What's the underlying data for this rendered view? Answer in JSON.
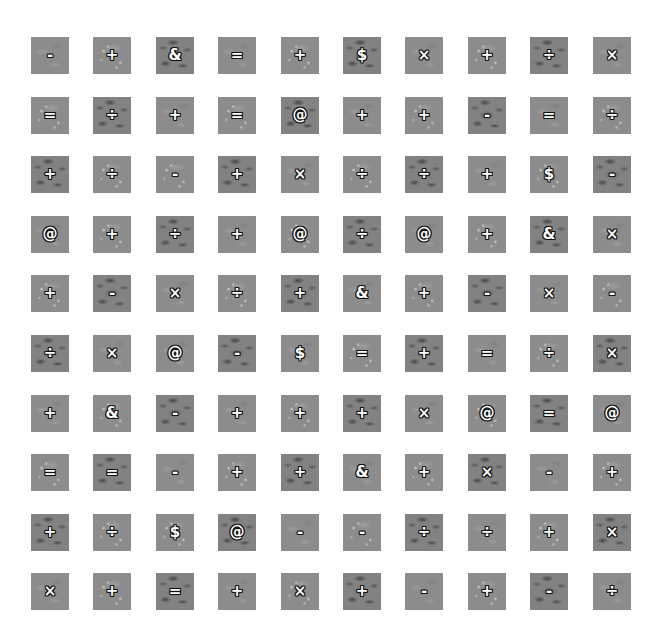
{
  "board": {
    "rows": 10,
    "cols": 10,
    "tiles": [
      [
        {
          "s": "-",
          "v": "plain"
        },
        {
          "s": "+",
          "v": "light"
        },
        {
          "s": "&",
          "v": "dark"
        },
        {
          "s": "=",
          "v": "plain"
        },
        {
          "s": "+",
          "v": "light"
        },
        {
          "s": "$",
          "v": "dark"
        },
        {
          "s": "×",
          "v": "plain"
        },
        {
          "s": "+",
          "v": "light"
        },
        {
          "s": "÷",
          "v": "dark"
        },
        {
          "s": "×",
          "v": "plain"
        }
      ],
      [
        {
          "s": "=",
          "v": "light"
        },
        {
          "s": "÷",
          "v": "dark"
        },
        {
          "s": "+",
          "v": "plain"
        },
        {
          "s": "=",
          "v": "light"
        },
        {
          "s": "@",
          "v": "dark"
        },
        {
          "s": "+",
          "v": "plain"
        },
        {
          "s": "+",
          "v": "light"
        },
        {
          "s": "-",
          "v": "dark"
        },
        {
          "s": "=",
          "v": "plain"
        },
        {
          "s": "÷",
          "v": "light"
        }
      ],
      [
        {
          "s": "+",
          "v": "dark"
        },
        {
          "s": "÷",
          "v": "light"
        },
        {
          "s": "-",
          "v": "light"
        },
        {
          "s": "+",
          "v": "dark"
        },
        {
          "s": "×",
          "v": "plain"
        },
        {
          "s": "÷",
          "v": "light"
        },
        {
          "s": "÷",
          "v": "dark"
        },
        {
          "s": "+",
          "v": "plain"
        },
        {
          "s": "$",
          "v": "light"
        },
        {
          "s": "-",
          "v": "dark"
        }
      ],
      [
        {
          "s": "@",
          "v": "plain"
        },
        {
          "s": "+",
          "v": "light"
        },
        {
          "s": "÷",
          "v": "dark"
        },
        {
          "s": "+",
          "v": "plain"
        },
        {
          "s": "@",
          "v": "light"
        },
        {
          "s": "÷",
          "v": "dark"
        },
        {
          "s": "@",
          "v": "plain"
        },
        {
          "s": "+",
          "v": "light"
        },
        {
          "s": "&",
          "v": "dark"
        },
        {
          "s": "×",
          "v": "plain"
        }
      ],
      [
        {
          "s": "+",
          "v": "light"
        },
        {
          "s": "-",
          "v": "dark"
        },
        {
          "s": "×",
          "v": "plain"
        },
        {
          "s": "÷",
          "v": "light"
        },
        {
          "s": "+",
          "v": "dark"
        },
        {
          "s": "&",
          "v": "plain"
        },
        {
          "s": "+",
          "v": "light"
        },
        {
          "s": "-",
          "v": "dark"
        },
        {
          "s": "×",
          "v": "plain"
        },
        {
          "s": "-",
          "v": "light"
        }
      ],
      [
        {
          "s": "÷",
          "v": "dark"
        },
        {
          "s": "×",
          "v": "plain"
        },
        {
          "s": "@",
          "v": "plain"
        },
        {
          "s": "-",
          "v": "dark"
        },
        {
          "s": "$",
          "v": "plain"
        },
        {
          "s": "=",
          "v": "light"
        },
        {
          "s": "+",
          "v": "dark"
        },
        {
          "s": "=",
          "v": "plain"
        },
        {
          "s": "÷",
          "v": "light"
        },
        {
          "s": "×",
          "v": "dark"
        }
      ],
      [
        {
          "s": "+",
          "v": "plain"
        },
        {
          "s": "&",
          "v": "light"
        },
        {
          "s": "-",
          "v": "dark"
        },
        {
          "s": "+",
          "v": "plain"
        },
        {
          "s": "+",
          "v": "light"
        },
        {
          "s": "+",
          "v": "dark"
        },
        {
          "s": "×",
          "v": "plain"
        },
        {
          "s": "@",
          "v": "light"
        },
        {
          "s": "=",
          "v": "dark"
        },
        {
          "s": "@",
          "v": "plain"
        }
      ],
      [
        {
          "s": "=",
          "v": "light"
        },
        {
          "s": "=",
          "v": "dark"
        },
        {
          "s": "-",
          "v": "plain"
        },
        {
          "s": "+",
          "v": "light"
        },
        {
          "s": "+",
          "v": "dark"
        },
        {
          "s": "&",
          "v": "plain"
        },
        {
          "s": "+",
          "v": "light"
        },
        {
          "s": "×",
          "v": "dark"
        },
        {
          "s": "-",
          "v": "plain"
        },
        {
          "s": "+",
          "v": "light"
        }
      ],
      [
        {
          "s": "+",
          "v": "dark"
        },
        {
          "s": "÷",
          "v": "light"
        },
        {
          "s": "$",
          "v": "light"
        },
        {
          "s": "@",
          "v": "dark"
        },
        {
          "s": "-",
          "v": "plain"
        },
        {
          "s": "-",
          "v": "light"
        },
        {
          "s": "÷",
          "v": "dark"
        },
        {
          "s": "÷",
          "v": "plain"
        },
        {
          "s": "+",
          "v": "light"
        },
        {
          "s": "×",
          "v": "dark"
        }
      ],
      [
        {
          "s": "×",
          "v": "plain"
        },
        {
          "s": "+",
          "v": "light"
        },
        {
          "s": "=",
          "v": "dark"
        },
        {
          "s": "+",
          "v": "plain"
        },
        {
          "s": "×",
          "v": "light"
        },
        {
          "s": "+",
          "v": "dark"
        },
        {
          "s": "-",
          "v": "plain"
        },
        {
          "s": "+",
          "v": "light"
        },
        {
          "s": "-",
          "v": "dark"
        },
        {
          "s": "÷",
          "v": "plain"
        }
      ]
    ]
  },
  "colors": {
    "background": "#ffffff",
    "tile": "#8c8c8c",
    "symbol_fill": "#ffffff",
    "symbol_outline": "#111111"
  }
}
